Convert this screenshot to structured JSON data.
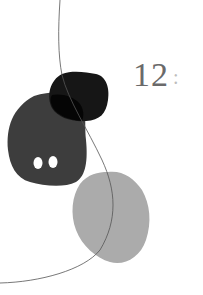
{
  "artwork": {
    "number": "12",
    "separator": ":",
    "colors": {
      "background": "#ffffff",
      "dark_blob": "#111111",
      "charcoal_blob": "#3d3d3d",
      "light_blob": "#ababab",
      "line": "#555555",
      "text": "#6a6a6a"
    }
  }
}
